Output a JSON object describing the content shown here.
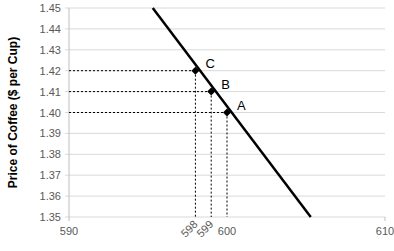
{
  "chart_data": {
    "type": "line",
    "title": "",
    "xlabel": "",
    "ylabel": "Price of Coffee ($ per Cup)",
    "xlim": [
      590,
      610
    ],
    "ylim": [
      1.35,
      1.45
    ],
    "x_ticks": [
      "590",
      "610"
    ],
    "x_extra_ticks": [
      "598",
      "599",
      "600"
    ],
    "y_ticks": [
      "1.45",
      "1.44",
      "1.43",
      "1.42",
      "1.41",
      "1.40",
      "1.39",
      "1.38",
      "1.37",
      "1.36",
      "1.35"
    ],
    "grid": true,
    "legend": null,
    "series": [
      {
        "name": "Demand",
        "x": [
          595.3,
          605.3
        ],
        "y": [
          1.45,
          1.35
        ],
        "color": "#000000"
      }
    ],
    "points": [
      {
        "label": "A",
        "x": 600,
        "y": 1.4
      },
      {
        "label": "B",
        "x": 599,
        "y": 1.41
      },
      {
        "label": "C",
        "x": 598,
        "y": 1.42
      }
    ],
    "annotations": "Dashed guide lines from each point to the axes"
  }
}
